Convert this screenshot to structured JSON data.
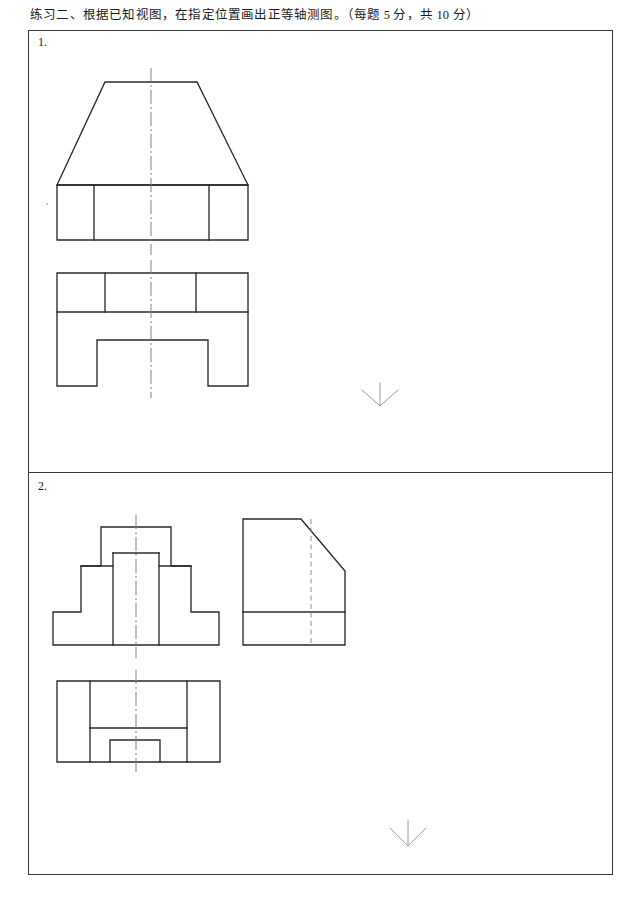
{
  "heading": {
    "text": "练习二、根据已知视图，在指定位置画出正等轴测图。（每题 5 分，共 10 分）"
  },
  "frame": {
    "border_color": "#3a3a3a"
  },
  "problems": [
    {
      "number": "1.",
      "prompt_marker": "down-arrow",
      "views": [
        {
          "name": "front-view",
          "description": "Trapezoid on rectangular base with three vertical division lines",
          "outline": "trapezoid-over-rectangle",
          "bounds": {
            "x": 57,
            "y": 82,
            "width": 191,
            "height": 158
          },
          "centerline_x": 151
        },
        {
          "name": "top-view",
          "description": "Rectangle with upper band divided in three and a bottom notch",
          "outline": "rectangle-with-notch",
          "bounds": {
            "x": 57,
            "y": 273,
            "width": 191,
            "height": 113
          },
          "centerline_x": 151
        }
      ]
    },
    {
      "number": "2.",
      "prompt_marker": "down-arrow",
      "views": [
        {
          "name": "front-view",
          "description": "Stepped T-shaped profile with central raised block",
          "outline": "stepped-t-profile",
          "bounds": {
            "x": 53,
            "y": 527,
            "width": 166,
            "height": 118
          },
          "centerline_x": 136
        },
        {
          "name": "side-view",
          "description": "Rectangle with chamfered top-right corner, base band and hidden line",
          "outline": "chamfered-rectangle",
          "bounds": {
            "x": 243,
            "y": 519,
            "width": 102,
            "height": 126
          },
          "hidden_line_x": 311
        },
        {
          "name": "top-view",
          "description": "Rectangle with H-shaped internal cut and bottom notch",
          "outline": "h-shape-with-notch",
          "bounds": {
            "x": 57,
            "y": 681,
            "width": 163,
            "height": 81
          },
          "centerline_x": 136
        }
      ]
    }
  ],
  "markers": [
    {
      "name": "answer-position-arrow-1",
      "glyph": "down-arrow",
      "x": 380,
      "y": 383
    },
    {
      "name": "answer-position-arrow-2",
      "glyph": "down-arrow",
      "x": 408,
      "y": 820
    }
  ],
  "colors": {
    "line": "#2b2b2b",
    "centerline": "#7d7d7d",
    "hidden_line": "#8c8c8c",
    "frame": "#3a3a3a",
    "marker": "#9a9a9a",
    "background": "#ffffff"
  }
}
